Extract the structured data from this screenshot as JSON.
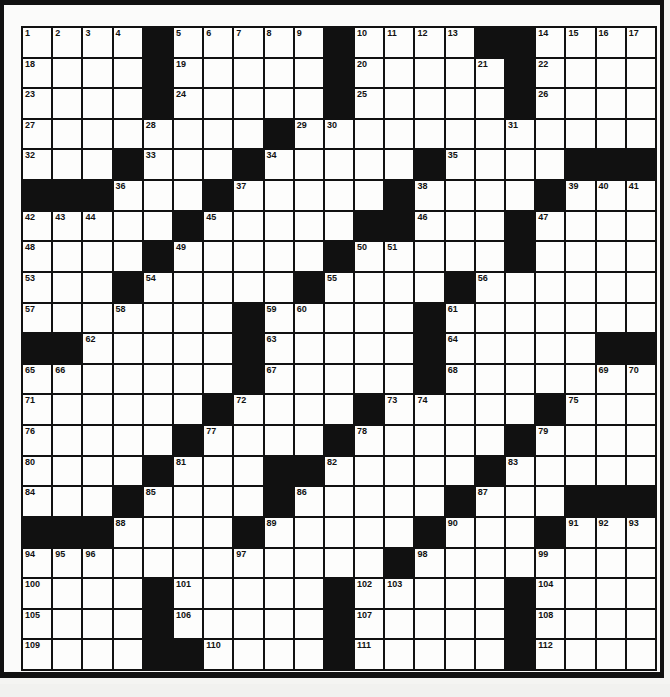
{
  "puzzle": {
    "rows": 21,
    "cols": 21,
    "colors": {
      "black": "#111111",
      "white": "#fdfdfc",
      "frame": "#111111"
    },
    "grid": [
      "....#.....#....##....",
      "....#.....#.....#....",
      "....#.....#.....#....",
      "........#............",
      "...#...#.....#....###",
      "###...#.....#....#...",
      ".....#.....##...#....",
      "....#.....#.....#....",
      "...#.....#....#......",
      ".......#.....#.......",
      "##.....#.....#.....##",
      ".......#.....#.......",
      "......#....#.....#...",
      ".....#....#.....#....",
      "....#...##.....#.....",
      "...#....#.....#...###",
      "###....#.....#...#...",
      "............#........",
      "....#.....#.....#....",
      "....#.....#.....#....",
      "....##....#.....#...."
    ],
    "numbers": [
      {
        "r": 0,
        "c": 0,
        "n": "1"
      },
      {
        "r": 0,
        "c": 1,
        "n": "2"
      },
      {
        "r": 0,
        "c": 2,
        "n": "3"
      },
      {
        "r": 0,
        "c": 3,
        "n": "4"
      },
      {
        "r": 0,
        "c": 5,
        "n": "5"
      },
      {
        "r": 0,
        "c": 6,
        "n": "6"
      },
      {
        "r": 0,
        "c": 7,
        "n": "7"
      },
      {
        "r": 0,
        "c": 8,
        "n": "8"
      },
      {
        "r": 0,
        "c": 9,
        "n": "9"
      },
      {
        "r": 0,
        "c": 11,
        "n": "10"
      },
      {
        "r": 0,
        "c": 12,
        "n": "11"
      },
      {
        "r": 0,
        "c": 13,
        "n": "12"
      },
      {
        "r": 0,
        "c": 14,
        "n": "13"
      },
      {
        "r": 0,
        "c": 17,
        "n": "14"
      },
      {
        "r": 0,
        "c": 18,
        "n": "15"
      },
      {
        "r": 0,
        "c": 19,
        "n": "16"
      },
      {
        "r": 0,
        "c": 20,
        "n": "17"
      },
      {
        "r": 1,
        "c": 0,
        "n": "18"
      },
      {
        "r": 1,
        "c": 5,
        "n": "19"
      },
      {
        "r": 1,
        "c": 11,
        "n": "20"
      },
      {
        "r": 1,
        "c": 15,
        "n": "21"
      },
      {
        "r": 1,
        "c": 17,
        "n": "22"
      },
      {
        "r": 2,
        "c": 0,
        "n": "23"
      },
      {
        "r": 2,
        "c": 5,
        "n": "24"
      },
      {
        "r": 2,
        "c": 11,
        "n": "25"
      },
      {
        "r": 2,
        "c": 17,
        "n": "26"
      },
      {
        "r": 3,
        "c": 0,
        "n": "27"
      },
      {
        "r": 3,
        "c": 4,
        "n": "28"
      },
      {
        "r": 3,
        "c": 9,
        "n": "29"
      },
      {
        "r": 3,
        "c": 10,
        "n": "30"
      },
      {
        "r": 3,
        "c": 16,
        "n": "31"
      },
      {
        "r": 4,
        "c": 0,
        "n": "32"
      },
      {
        "r": 4,
        "c": 4,
        "n": "33"
      },
      {
        "r": 4,
        "c": 8,
        "n": "34"
      },
      {
        "r": 4,
        "c": 14,
        "n": "35"
      },
      {
        "r": 5,
        "c": 3,
        "n": "36"
      },
      {
        "r": 5,
        "c": 7,
        "n": "37"
      },
      {
        "r": 5,
        "c": 13,
        "n": "38"
      },
      {
        "r": 5,
        "c": 18,
        "n": "39"
      },
      {
        "r": 5,
        "c": 19,
        "n": "40"
      },
      {
        "r": 5,
        "c": 20,
        "n": "41"
      },
      {
        "r": 6,
        "c": 0,
        "n": "42"
      },
      {
        "r": 6,
        "c": 1,
        "n": "43"
      },
      {
        "r": 6,
        "c": 2,
        "n": "44"
      },
      {
        "r": 6,
        "c": 6,
        "n": "45"
      },
      {
        "r": 6,
        "c": 13,
        "n": "46"
      },
      {
        "r": 6,
        "c": 17,
        "n": "47"
      },
      {
        "r": 7,
        "c": 0,
        "n": "48"
      },
      {
        "r": 7,
        "c": 5,
        "n": "49"
      },
      {
        "r": 7,
        "c": 11,
        "n": "50"
      },
      {
        "r": 7,
        "c": 12,
        "n": "51"
      },
      {
        "r": 7,
        "c": 16,
        "n": "52"
      },
      {
        "r": 8,
        "c": 0,
        "n": "53"
      },
      {
        "r": 8,
        "c": 4,
        "n": "54"
      },
      {
        "r": 8,
        "c": 10,
        "n": "55"
      },
      {
        "r": 8,
        "c": 15,
        "n": "56"
      },
      {
        "r": 9,
        "c": 0,
        "n": "57"
      },
      {
        "r": 9,
        "c": 3,
        "n": "58"
      },
      {
        "r": 9,
        "c": 8,
        "n": "59"
      },
      {
        "r": 9,
        "c": 9,
        "n": "60"
      },
      {
        "r": 9,
        "c": 14,
        "n": "61"
      },
      {
        "r": 10,
        "c": 2,
        "n": "62"
      },
      {
        "r": 10,
        "c": 8,
        "n": "63"
      },
      {
        "r": 10,
        "c": 14,
        "n": "64"
      },
      {
        "r": 11,
        "c": 0,
        "n": "65"
      },
      {
        "r": 11,
        "c": 1,
        "n": "66"
      },
      {
        "r": 11,
        "c": 8,
        "n": "67"
      },
      {
        "r": 11,
        "c": 14,
        "n": "68"
      },
      {
        "r": 11,
        "c": 19,
        "n": "69"
      },
      {
        "r": 11,
        "c": 20,
        "n": "70"
      },
      {
        "r": 12,
        "c": 0,
        "n": "71"
      },
      {
        "r": 12,
        "c": 7,
        "n": "72"
      },
      {
        "r": 12,
        "c": 12,
        "n": "73"
      },
      {
        "r": 12,
        "c": 13,
        "n": "74"
      },
      {
        "r": 12,
        "c": 18,
        "n": "75"
      },
      {
        "r": 13,
        "c": 0,
        "n": "76"
      },
      {
        "r": 13,
        "c": 6,
        "n": "77"
      },
      {
        "r": 13,
        "c": 11,
        "n": "78"
      },
      {
        "r": 13,
        "c": 17,
        "n": "79"
      },
      {
        "r": 14,
        "c": 0,
        "n": "80"
      },
      {
        "r": 14,
        "c": 5,
        "n": "81"
      },
      {
        "r": 14,
        "c": 10,
        "n": "82"
      },
      {
        "r": 14,
        "c": 16,
        "n": "83"
      },
      {
        "r": 15,
        "c": 0,
        "n": "84"
      },
      {
        "r": 15,
        "c": 4,
        "n": "85"
      },
      {
        "r": 15,
        "c": 9,
        "n": "86"
      },
      {
        "r": 15,
        "c": 15,
        "n": "87"
      },
      {
        "r": 16,
        "c": 3,
        "n": "88"
      },
      {
        "r": 16,
        "c": 8,
        "n": "89"
      },
      {
        "r": 16,
        "c": 14,
        "n": "90"
      },
      {
        "r": 16,
        "c": 18,
        "n": "91"
      },
      {
        "r": 16,
        "c": 19,
        "n": "92"
      },
      {
        "r": 16,
        "c": 20,
        "n": "93"
      },
      {
        "r": 17,
        "c": 0,
        "n": "94"
      },
      {
        "r": 17,
        "c": 1,
        "n": "95"
      },
      {
        "r": 17,
        "c": 2,
        "n": "96"
      },
      {
        "r": 17,
        "c": 7,
        "n": "97"
      },
      {
        "r": 17,
        "c": 13,
        "n": "98"
      },
      {
        "r": 17,
        "c": 17,
        "n": "99"
      },
      {
        "r": 18,
        "c": 0,
        "n": "100"
      },
      {
        "r": 18,
        "c": 5,
        "n": "101"
      },
      {
        "r": 18,
        "c": 11,
        "n": "102"
      },
      {
        "r": 18,
        "c": 12,
        "n": "103"
      },
      {
        "r": 18,
        "c": 17,
        "n": "104"
      },
      {
        "r": 19,
        "c": 0,
        "n": "105"
      },
      {
        "r": 19,
        "c": 5,
        "n": "106"
      },
      {
        "r": 19,
        "c": 11,
        "n": "107"
      },
      {
        "r": 19,
        "c": 17,
        "n": "108"
      },
      {
        "r": 20,
        "c": 0,
        "n": "109"
      },
      {
        "r": 20,
        "c": 6,
        "n": "110"
      },
      {
        "r": 20,
        "c": 11,
        "n": "111"
      },
      {
        "r": 20,
        "c": 17,
        "n": "112"
      }
    ]
  }
}
